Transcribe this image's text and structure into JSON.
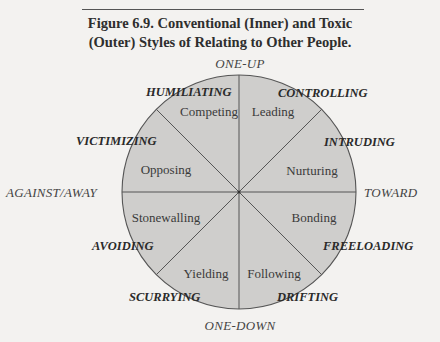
{
  "figure": {
    "title_line1": "Figure 6.9.  Conventional (Inner) and Toxic",
    "title_line2": "(Outer) Styles of Relating to Other People."
  },
  "axes": {
    "top": "ONE-UP",
    "bottom": "ONE-DOWN",
    "left": "AGAINST/AWAY",
    "right": "TOWARD"
  },
  "inner_styles": [
    {
      "label": "Competing"
    },
    {
      "label": "Leading"
    },
    {
      "label": "Nurturing"
    },
    {
      "label": "Bonding"
    },
    {
      "label": "Following"
    },
    {
      "label": "Yielding"
    },
    {
      "label": "Stonewalling"
    },
    {
      "label": "Opposing"
    }
  ],
  "outer_styles": [
    {
      "label": "HUMILIATING"
    },
    {
      "label": "CONTROLLING"
    },
    {
      "label": "INTRUDING"
    },
    {
      "label": "FREELOADING"
    },
    {
      "label": "DRIFTING"
    },
    {
      "label": "SCURRYING"
    },
    {
      "label": "AVOIDING"
    },
    {
      "label": "VICTIMIZING"
    }
  ],
  "colors": {
    "circle_fill": "#cfcecc",
    "line": "#555555",
    "background": "#f3f2f0"
  }
}
